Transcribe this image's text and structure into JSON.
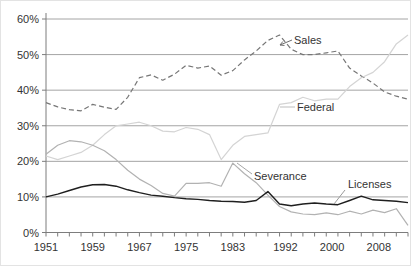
{
  "figure": {
    "width": 411,
    "height": 266,
    "background": "#ffffff",
    "text_color": "#333333",
    "grid_color": "#9a9a9a",
    "axis_color": "#7d7d7d"
  },
  "chart_data": {
    "type": "line",
    "title": "",
    "xlabel": "",
    "ylabel": "",
    "grid": "horizontal",
    "legend_position": "inline-annotations",
    "y_range": [
      0,
      60
    ],
    "y_tick_step": 10,
    "y_tick_labels": [
      "0%",
      "10%",
      "20%",
      "30%",
      "40%",
      "50%",
      "60%"
    ],
    "x_range": [
      1951,
      2013
    ],
    "x_minor_tick_step_years": 2,
    "x_tick_labels": [
      "1951",
      "1959",
      "1967",
      "1975",
      "1983",
      "1992",
      "2000",
      "2008"
    ],
    "x_tick_label_years": [
      1951,
      1959,
      1967,
      1975,
      1983,
      1992,
      2000,
      2008
    ],
    "x": [
      1951,
      1953,
      1955,
      1957,
      1959,
      1961,
      1963,
      1965,
      1967,
      1969,
      1971,
      1973,
      1975,
      1977,
      1979,
      1981,
      1983,
      1985,
      1987,
      1989,
      1991,
      1993,
      1995,
      1997,
      1999,
      2001,
      2003,
      2005,
      2007,
      2009,
      2011,
      2013
    ],
    "series": [
      {
        "name": "Sales",
        "color": "#767676",
        "dash": "5,3",
        "width": 1.2,
        "values": [
          36.5,
          35.3,
          34.5,
          34.2,
          36.0,
          35.2,
          34.6,
          38.0,
          43.5,
          44.3,
          42.8,
          44.5,
          47.0,
          46.2,
          46.8,
          44.2,
          45.5,
          48.5,
          51.0,
          54.0,
          55.5,
          51.5,
          50.0,
          50.0,
          50.5,
          51.0,
          46.2,
          44.0,
          42.0,
          39.5,
          38.3,
          37.5
        ]
      },
      {
        "name": "Federal",
        "color": "#d4d4d4",
        "dash": null,
        "width": 1.2,
        "values": [
          21.5,
          20.5,
          21.5,
          22.5,
          24.5,
          27.5,
          30.0,
          30.5,
          31.0,
          30.0,
          28.5,
          28.3,
          29.5,
          29.0,
          27.5,
          20.5,
          24.5,
          27.0,
          27.5,
          28.0,
          36.0,
          36.5,
          38.0,
          37.0,
          37.5,
          37.5,
          41.0,
          43.5,
          45.0,
          48.0,
          53.0,
          55.5
        ]
      },
      {
        "name": "Severance",
        "color": "#b2b2b2",
        "dash": null,
        "width": 1.2,
        "values": [
          22.0,
          24.5,
          25.8,
          25.5,
          24.5,
          23.0,
          20.5,
          17.5,
          15.0,
          13.2,
          11.0,
          10.2,
          13.8,
          13.8,
          14.0,
          13.0,
          19.5,
          16.5,
          14.0,
          10.5,
          7.3,
          5.8,
          5.2,
          5.0,
          5.5,
          5.0,
          6.0,
          5.2,
          6.3,
          5.6,
          6.7,
          2.0
        ]
      },
      {
        "name": "Licenses",
        "color": "#1f1f1f",
        "dash": null,
        "width": 1.4,
        "values": [
          10.0,
          10.8,
          11.8,
          12.8,
          13.4,
          13.5,
          13.0,
          12.0,
          11.2,
          10.5,
          10.2,
          9.8,
          9.5,
          9.3,
          9.0,
          8.8,
          8.7,
          8.5,
          9.0,
          11.5,
          8.0,
          7.5,
          8.0,
          8.3,
          8.0,
          7.8,
          9.0,
          10.2,
          9.2,
          9.0,
          8.8,
          8.4
        ]
      }
    ],
    "annotations": [
      {
        "label": "Sales",
        "text_px": [
          293,
          33
        ],
        "leader_px": [
          [
            291,
            39
          ],
          [
            279,
            44
          ]
        ],
        "arrowhead": true,
        "leader_color": "#6e6e6e"
      },
      {
        "label": "Federal",
        "text_px": [
          296,
          100
        ],
        "leader_px": [
          [
            294,
            106
          ],
          [
            279,
            106
          ]
        ],
        "arrowhead": false,
        "leader_color": "#bdbdbd"
      },
      {
        "label": "Severance",
        "text_px": [
          253,
          169
        ],
        "leader_px": [
          [
            251,
            173
          ],
          [
            236,
            162
          ]
        ],
        "arrowhead": false,
        "leader_color": "#a6a6a6"
      },
      {
        "label": "Licenses",
        "text_px": [
          347,
          177
        ],
        "leader_px": [
          [
            344,
            189
          ],
          [
            333,
            203
          ]
        ],
        "arrowhead": false,
        "leader_color": "#9a9a9a"
      }
    ]
  }
}
